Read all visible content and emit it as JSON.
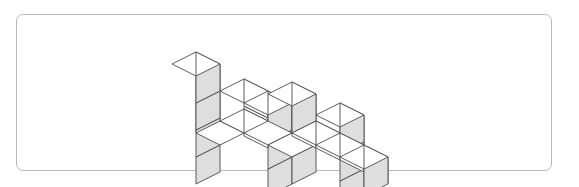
{
  "figure": {
    "frame": {
      "x": 16,
      "y": 14,
      "width": 536,
      "height": 157,
      "corner_radius": 7,
      "border_color": "#b9b9b9",
      "fill_color": "#ffffff"
    },
    "projection": {
      "type": "isometric",
      "origin_x": 268,
      "origin_y": 124,
      "half_width": 24,
      "half_depth": 12,
      "cube_height": 27
    },
    "colors": {
      "top_face": "#ffffff",
      "left_face": "#ffffff",
      "right_face": "#dedede",
      "stroke": "#4a4a4a",
      "background": "#ffffff"
    },
    "stroke_width": 0.9,
    "total_cubes": 21,
    "columns": [
      {
        "x": 0,
        "y": 3,
        "height": 4,
        "label": "left-tower"
      },
      {
        "x": 0,
        "y": 2,
        "height": 1,
        "label": "left-base-a"
      },
      {
        "x": 0,
        "y": 1,
        "height": 1,
        "label": "left-base-b"
      },
      {
        "x": 1,
        "y": 1,
        "height": 1,
        "label": "mid-left-low"
      },
      {
        "x": 1,
        "y": 0,
        "height": 2,
        "label": "mid-left-step"
      },
      {
        "x": 2,
        "y": 1,
        "height": 1,
        "label": "mid-front-low"
      },
      {
        "x": 1,
        "y": 2,
        "height": 3,
        "label": "mid-back-left"
      },
      {
        "x": 2,
        "y": 2,
        "height": 3,
        "label": "mid-back-right"
      },
      {
        "x": 2,
        "y": 0,
        "height": 1,
        "label": "front-nub"
      },
      {
        "x": 3,
        "y": 0,
        "height": 1,
        "label": "right-low-a"
      },
      {
        "x": 4,
        "y": 0,
        "height": 1,
        "label": "right-low-b"
      },
      {
        "x": 4,
        "y": 1,
        "height": 3,
        "label": "right-tower"
      }
    ]
  }
}
